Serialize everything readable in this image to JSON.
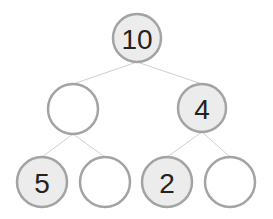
{
  "diagram": {
    "type": "binary-tree",
    "colors": {
      "filled_node": "#ececec",
      "empty_node": "#ffffff",
      "node_stroke": "#a3a3a3",
      "edge": "#cfcfcf",
      "text": "#222222"
    },
    "nodes": [
      {
        "id": "root",
        "label": "10",
        "filled": true,
        "cx": 137,
        "cy": 38,
        "r": 24
      },
      {
        "id": "left",
        "label": "",
        "filled": false,
        "cx": 73,
        "cy": 109,
        "r": 25
      },
      {
        "id": "right",
        "label": "4",
        "filled": true,
        "cx": 202,
        "cy": 108,
        "r": 24
      },
      {
        "id": "left-left",
        "label": "5",
        "filled": true,
        "cx": 42,
        "cy": 182,
        "r": 25
      },
      {
        "id": "left-right",
        "label": "",
        "filled": false,
        "cx": 105,
        "cy": 182,
        "r": 25
      },
      {
        "id": "right-left",
        "label": "2",
        "filled": true,
        "cx": 167,
        "cy": 182,
        "r": 25
      },
      {
        "id": "right-right",
        "label": "",
        "filled": false,
        "cx": 230,
        "cy": 182,
        "r": 25
      }
    ],
    "edges": [
      {
        "from": "root",
        "to": "left"
      },
      {
        "from": "root",
        "to": "right"
      },
      {
        "from": "left",
        "to": "left-left"
      },
      {
        "from": "left",
        "to": "left-right"
      },
      {
        "from": "right",
        "to": "right-left"
      },
      {
        "from": "right",
        "to": "right-right"
      }
    ]
  }
}
